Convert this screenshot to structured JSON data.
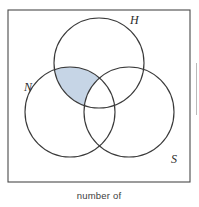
{
  "figure": {
    "kind": "venn-diagram",
    "title": "",
    "caption": "number of",
    "frame": {
      "x": 8,
      "y": 10,
      "width": 182,
      "height": 172,
      "stroke_color": "#4a4a4a",
      "fill_color": "#ffffff"
    },
    "sets": [
      {
        "id": "H",
        "label": "H",
        "cx": 99,
        "cy": 63,
        "r": 45,
        "label_x": 130,
        "label_y": 24
      },
      {
        "id": "N",
        "label": "N",
        "cx": 70,
        "cy": 112,
        "r": 45,
        "label_x": 24,
        "label_y": 91
      },
      {
        "id": "S",
        "label": "S",
        "cx": 129,
        "cy": 112,
        "r": 45,
        "label_x": 171,
        "label_y": 163
      }
    ],
    "shaded_region": {
      "description": "H and N only, excluding S",
      "expression": "(H ∩ N) \\ S",
      "fill_color": "#c6d5e6",
      "stroke_color": "#3a3a3a"
    },
    "circle_stroke_color": "#3a3a3a",
    "background_color": "#ffffff"
  }
}
